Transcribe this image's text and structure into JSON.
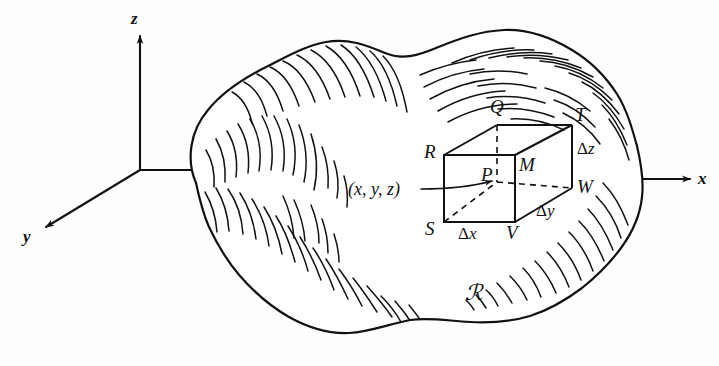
{
  "figure": {
    "kind": "hand-drawn-math-diagram",
    "ink_color": "#111111",
    "background_color": "#ffffff"
  },
  "axes": {
    "x_label": "x",
    "y_label": "y",
    "z_label": "z",
    "origin_note": "axes meet at left of region"
  },
  "region": {
    "label": "ℛ"
  },
  "box": {
    "point_label": "P",
    "coordinate_label": "(x, y, z)",
    "vertices": [
      {
        "name": "Q",
        "label": "Q"
      },
      {
        "name": "T",
        "label": "T"
      },
      {
        "name": "R",
        "label": "R"
      },
      {
        "name": "M",
        "label": "M"
      },
      {
        "name": "W",
        "label": "W"
      },
      {
        "name": "S",
        "label": "S"
      },
      {
        "name": "V",
        "label": "V"
      }
    ],
    "dimensions": [
      {
        "name": "delta-x",
        "symbol": "Δ",
        "variable": "x"
      },
      {
        "name": "delta-y",
        "symbol": "Δ",
        "variable": "y"
      },
      {
        "name": "delta-z",
        "symbol": "Δ",
        "variable": "z"
      }
    ]
  }
}
